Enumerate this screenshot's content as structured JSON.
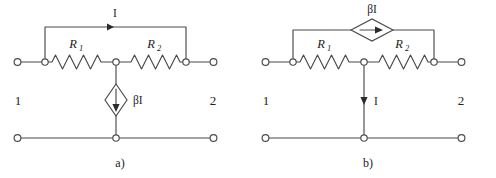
{
  "figure": {
    "background_color": "#ffffff",
    "line_color": "#4a4a4a",
    "text_color": "#1c1c1c",
    "width": 496,
    "height": 178
  },
  "panels": [
    {
      "id": "a",
      "caption": "a)",
      "port_left_label": "1",
      "port_right_label": "2",
      "resistor_1_label": "R",
      "resistor_1_subscript": "1",
      "resistor_2_label": "R",
      "resistor_2_subscript": "2",
      "source_label": "βI",
      "source_type": "dependent-current-source",
      "source_orientation": "vertical",
      "source_arrow_direction": "down",
      "current_label": "I",
      "current_arrow_direction": "right",
      "current_arrow_location": "top-bypass-wire"
    },
    {
      "id": "b",
      "caption": "b)",
      "port_left_label": "1",
      "port_right_label": "2",
      "resistor_1_label": "R",
      "resistor_1_subscript": "1",
      "resistor_2_label": "R",
      "resistor_2_subscript": "2",
      "source_label": "βI",
      "source_type": "dependent-current-source",
      "source_orientation": "horizontal",
      "source_arrow_direction": "right",
      "current_label": "I",
      "current_arrow_direction": "down",
      "current_arrow_location": "shunt-branch"
    }
  ]
}
